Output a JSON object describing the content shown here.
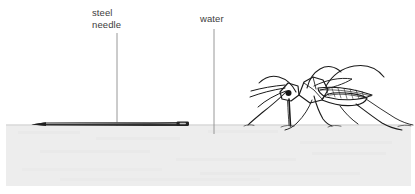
{
  "figure": {
    "width": 415,
    "height": 194,
    "background_color": "#ffffff"
  },
  "labels": {
    "steel_needle": "steel\nneedle",
    "steel_needle_line1": "steel",
    "steel_needle_line2": "needle",
    "water": "water"
  },
  "colors": {
    "label_text": "#3d3d3d",
    "leader_line": "#8a8a8a",
    "water_fill": "#ededed",
    "water_surface_line": "#c9c9c9",
    "needle_body": "#2b2b2b",
    "needle_highlight": "#9a9a9a",
    "insect_ink": "#1a1a1a",
    "page_background": "#ffffff"
  },
  "annotations": {
    "needle_leader": {
      "x": 117,
      "y_top": 33,
      "y_bottom": 126
    },
    "water_leader": {
      "x": 214,
      "y_top": 29,
      "y_bottom": 134
    }
  },
  "water_surface": {
    "y": 125,
    "bottom_y": 186,
    "left_x": 6,
    "right_x": 411
  },
  "needle": {
    "tip_x": 31,
    "eye_x": 188,
    "center_y": 124,
    "length": 157
  },
  "insect": {
    "name": "mosquito",
    "bounds_x": 243,
    "bounds_y": 64,
    "bounds_width": 170,
    "bounds_height": 66
  }
}
